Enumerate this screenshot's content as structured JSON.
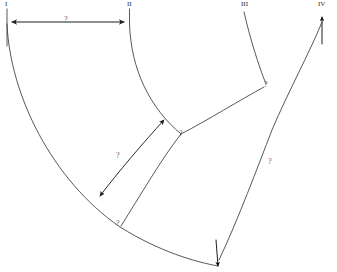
{
  "figure": {
    "type": "line-diagram",
    "background_color": "#ffffff",
    "stroke_color": "#3a3a3a",
    "label_color": "#2b2b2b",
    "annotation_color": "#5c5c5c",
    "width": 337,
    "height": 272,
    "truncated_top_caption": ""
  },
  "nodes": [
    {
      "id": "I",
      "label": "I",
      "x": 6,
      "y": 3
    },
    {
      "id": "II",
      "label": "II",
      "x": 128,
      "y": 3
    },
    {
      "id": "III",
      "label": "III",
      "x": 243,
      "y": 3
    },
    {
      "id": "IV",
      "label": "IV",
      "x": 326,
      "y": 3
    }
  ],
  "annotations": [
    {
      "id": "a1",
      "label": "?",
      "x": 66,
      "y": 20,
      "on": "top-horizontal-double-arrow"
    },
    {
      "id": "a2",
      "label": "?",
      "x": 118,
      "y": 156,
      "on": "left-double-arrow-curve"
    },
    {
      "id": "a3",
      "label": "?",
      "x": 181,
      "y": 134,
      "on": "center-junction"
    },
    {
      "id": "a4",
      "label": "?",
      "x": 266,
      "y": 85,
      "on": "upper-right-junction"
    },
    {
      "id": "a5",
      "label": "?",
      "x": 270,
      "y": 162,
      "on": "lower-right-curve"
    },
    {
      "id": "a6",
      "label": "?",
      "x": 118,
      "y": 224,
      "on": "bottom-left-junction"
    }
  ],
  "measurements": {
    "top_span": {
      "from": "I",
      "to": "II",
      "label": "?",
      "arrow": "double"
    },
    "mid_span": {
      "label": "?",
      "arrow": "double"
    }
  }
}
